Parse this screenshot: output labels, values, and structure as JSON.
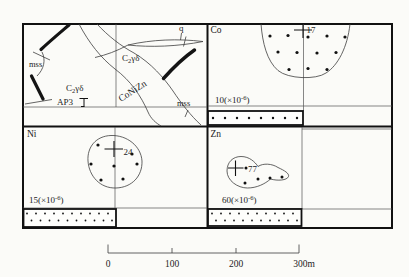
{
  "figure": {
    "geology": {
      "mss_upper": "mss",
      "mss_lower": "mss",
      "quartz_label": "q",
      "orebody_label": "CoNiZn",
      "adit_label": "AP3",
      "unit": {
        "main": "C",
        "sub": "2",
        "suffix": "γδ"
      }
    },
    "co": {
      "title": "Co",
      "peak": "17",
      "threshold": {
        "pre": "10(×10",
        "sup": "-6",
        "post": ")"
      }
    },
    "ni": {
      "title": "Ni",
      "peak": "24",
      "threshold": {
        "pre": "15(×10",
        "sup": "-6",
        "post": ")"
      }
    },
    "zn": {
      "title": "Zn",
      "peak": "77",
      "threshold": {
        "pre": "60(×10",
        "sup": "-6",
        "post": ")"
      }
    },
    "scale": {
      "t0": "0",
      "t1": "100",
      "t2": "200",
      "t3": "300m"
    }
  }
}
